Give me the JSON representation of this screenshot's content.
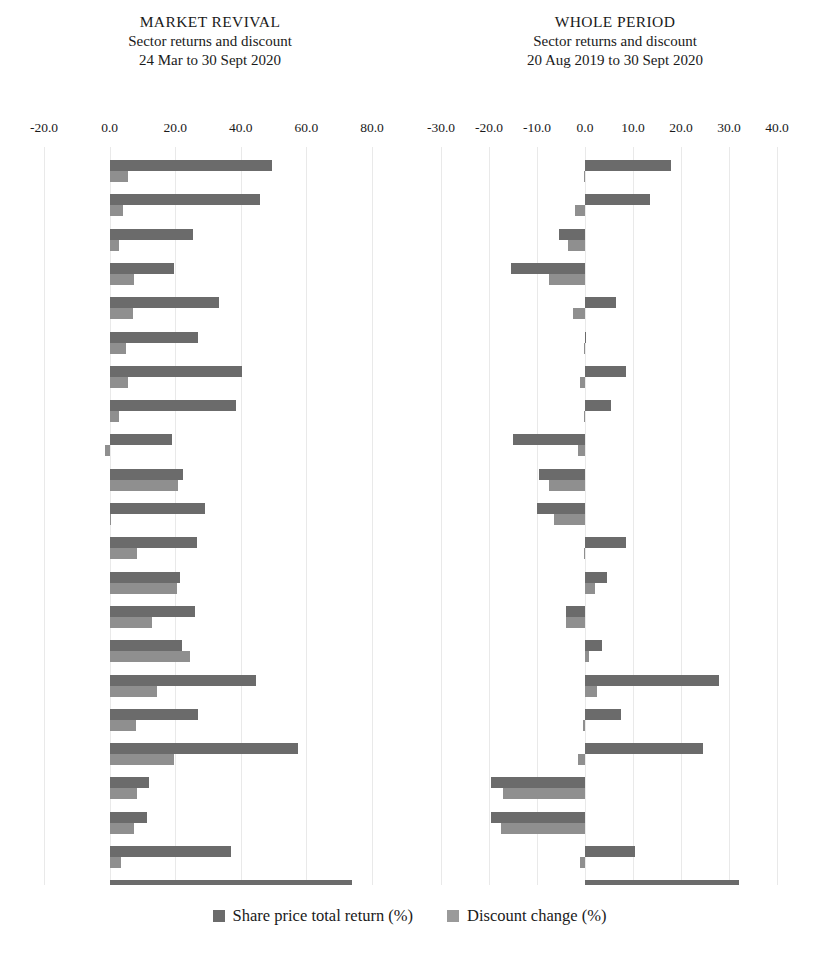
{
  "panels": [
    {
      "id": "market-revival",
      "title": "MARKET REVIVAL",
      "subtitle": "Sector returns and discount",
      "period": "24 Mar to 30 Sept 2020"
    },
    {
      "id": "whole-period",
      "title": "WHOLE PERIOD",
      "subtitle": "Sector returns and discount",
      "period": "20 Aug 2019 to 30 Sept 2020"
    }
  ],
  "legend": {
    "position": "bottom-center",
    "items": [
      {
        "label": "Share price total return (%)",
        "color": "#6b6b6b",
        "key": "share_price_total_return"
      },
      {
        "label": "Discount change (%)",
        "color": "#9a9a9a",
        "key": "discount_change"
      }
    ]
  },
  "colors": {
    "share_price_total_return": "#6b6b6b",
    "discount_change": "#8f8f8f",
    "gridline": "#e9e9e9",
    "text": "#1a1a1a",
    "background": "#ffffff"
  },
  "chart_data": [
    {
      "type": "bar",
      "orientation": "horizontal",
      "title": "MARKET REVIVAL",
      "subtitle": "Sector returns and discount",
      "annotation": "24 Mar to 30 Sept 2020",
      "xlabel": "",
      "ylabel": "",
      "xlim": [
        -20.0,
        80.0
      ],
      "xticks": [
        -20.0,
        0.0,
        20.0,
        40.0,
        60.0,
        80.0
      ],
      "xtick_labels": [
        "-20.0",
        "0.0",
        "20.0",
        "40.0",
        "60.0",
        "80.0"
      ],
      "grid": true,
      "legend": [
        "Share price total return (%)",
        "Discount change (%)"
      ],
      "categories": [
        "Row 1",
        "Row 2",
        "Row 3",
        "Row 4",
        "Row 5",
        "Row 6",
        "Row 7",
        "Row 8",
        "Row 9",
        "Row 10",
        "Row 11",
        "Row 12",
        "Row 13",
        "Row 14",
        "Row 15",
        "Row 16",
        "Row 17",
        "Row 18",
        "Row 19",
        "Row 20",
        "Row 21"
      ],
      "series": [
        {
          "name": "Share price total return (%)",
          "color": "#6b6b6b",
          "values": [
            49.5,
            46.0,
            25.5,
            19.5,
            33.5,
            27.0,
            40.5,
            38.5,
            19.0,
            22.5,
            29.0,
            26.5,
            21.5,
            26.0,
            22.0,
            44.5,
            27.0,
            57.5,
            12.0,
            11.5,
            37.0,
            74.0
          ]
        },
        {
          "name": "Discount change (%)",
          "color": "#8f8f8f",
          "values": [
            5.5,
            4.0,
            3.0,
            7.5,
            7.0,
            5.0,
            5.5,
            3.0,
            -1.5,
            21.0,
            0.5,
            8.5,
            20.5,
            13.0,
            24.5,
            14.5,
            8.0,
            19.5,
            8.5,
            7.5,
            3.5,
            12.0
          ]
        }
      ]
    },
    {
      "type": "bar",
      "orientation": "horizontal",
      "title": "WHOLE PERIOD",
      "subtitle": "Sector returns and discount",
      "annotation": "20 Aug 2019 to 30 Sept 2020",
      "xlabel": "",
      "ylabel": "",
      "xlim": [
        -30.0,
        40.0
      ],
      "xticks": [
        -30.0,
        -20.0,
        -10.0,
        0.0,
        10.0,
        20.0,
        30.0,
        40.0
      ],
      "xtick_labels": [
        "-30.0",
        "-20.0",
        "-10.0",
        "0.0",
        "10.0",
        "20.0",
        "30.0",
        "40.0"
      ],
      "grid": true,
      "legend": [
        "Share price total return (%)",
        "Discount change (%)"
      ],
      "categories": [
        "Row 1",
        "Row 2",
        "Row 3",
        "Row 4",
        "Row 5",
        "Row 6",
        "Row 7",
        "Row 8",
        "Row 9",
        "Row 10",
        "Row 11",
        "Row 12",
        "Row 13",
        "Row 14",
        "Row 15",
        "Row 16",
        "Row 17",
        "Row 18",
        "Row 19",
        "Row 20",
        "Row 21"
      ],
      "series": [
        {
          "name": "Share price total return (%)",
          "color": "#6b6b6b",
          "values": [
            18.0,
            13.5,
            -5.5,
            -15.5,
            6.5,
            0.3,
            8.5,
            5.5,
            -15.0,
            -9.5,
            -10.0,
            8.5,
            4.5,
            -4.0,
            3.5,
            28.0,
            7.5,
            24.5,
            -19.5,
            -19.5,
            10.5,
            32.0
          ]
        },
        {
          "name": "Discount change (%)",
          "color": "#8f8f8f",
          "values": [
            -0.3,
            -2.0,
            -3.5,
            -7.5,
            -2.5,
            -0.3,
            -1.0,
            -0.3,
            -1.5,
            -7.5,
            -6.5,
            -0.3,
            2.0,
            -4.0,
            0.8,
            2.5,
            -0.5,
            -1.5,
            -17.0,
            -17.5,
            -1.0,
            12.5
          ]
        }
      ]
    }
  ]
}
